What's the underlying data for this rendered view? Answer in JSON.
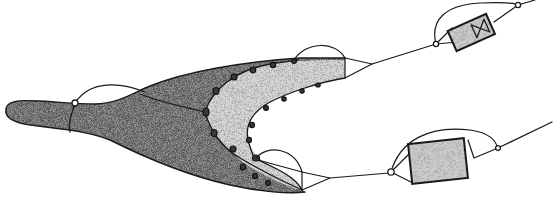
{
  "figure": {
    "background": "#ffffff",
    "ink_color": "#1a1a1a",
    "shade_dark": "#8c8c8c",
    "shade_light": "#d6d6d6",
    "parts": [
      {
        "id": "main-trunk",
        "shading": "dark"
      },
      {
        "id": "inner-crescent",
        "shading": "light"
      },
      {
        "id": "upper-module",
        "shading": "light",
        "glyph": "valve-symbol"
      },
      {
        "id": "lower-module",
        "shading": "light"
      }
    ]
  }
}
